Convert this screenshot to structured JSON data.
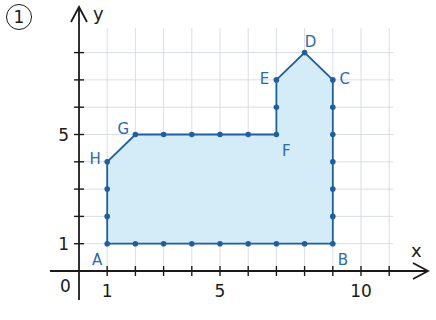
{
  "exercise": {
    "number_label": "1"
  },
  "axes": {
    "x_label": "x",
    "y_label": "y",
    "origin_label": "0",
    "x_tick_labels": [
      {
        "value": 1,
        "label": "1"
      },
      {
        "value": 5,
        "label": "5"
      },
      {
        "value": 10,
        "label": "10"
      }
    ],
    "y_tick_labels": [
      {
        "value": 1,
        "label": "1"
      },
      {
        "value": 5,
        "label": "5"
      }
    ]
  },
  "colors": {
    "axis": "#1a1a1a",
    "grid": "#cfd6dc",
    "polygon_stroke": "#1f5f9e",
    "polygon_fill": "#d4ecf8",
    "point": "#1f5f9e",
    "vertex_label": "#2a6aab"
  },
  "polygon": {
    "vertices": [
      {
        "name": "A",
        "x": 1,
        "y": 1
      },
      {
        "name": "B",
        "x": 9,
        "y": 1
      },
      {
        "name": "C",
        "x": 9,
        "y": 7
      },
      {
        "name": "D",
        "x": 8,
        "y": 8
      },
      {
        "name": "E",
        "x": 7,
        "y": 7
      },
      {
        "name": "F",
        "x": 7,
        "y": 5
      },
      {
        "name": "G",
        "x": 2,
        "y": 5
      },
      {
        "name": "H",
        "x": 1,
        "y": 4
      }
    ]
  },
  "chart_data": {
    "type": "scatter",
    "title": "1",
    "xlabel": "x",
    "ylabel": "y",
    "xlim": [
      0,
      11
    ],
    "ylim": [
      0,
      8
    ],
    "grid": true,
    "series": [
      {
        "name": "Polygon ABCDEFGH",
        "points": [
          {
            "label": "A",
            "x": 1,
            "y": 1
          },
          {
            "label": "B",
            "x": 9,
            "y": 1
          },
          {
            "label": "C",
            "x": 9,
            "y": 7
          },
          {
            "label": "D",
            "x": 8,
            "y": 8
          },
          {
            "label": "E",
            "x": 7,
            "y": 7
          },
          {
            "label": "F",
            "x": 7,
            "y": 5
          },
          {
            "label": "G",
            "x": 2,
            "y": 5
          },
          {
            "label": "H",
            "x": 1,
            "y": 4
          }
        ]
      }
    ],
    "lattice_points_on_boundary": [
      [
        1,
        1
      ],
      [
        2,
        1
      ],
      [
        3,
        1
      ],
      [
        4,
        1
      ],
      [
        5,
        1
      ],
      [
        6,
        1
      ],
      [
        7,
        1
      ],
      [
        8,
        1
      ],
      [
        9,
        1
      ],
      [
        9,
        2
      ],
      [
        9,
        3
      ],
      [
        9,
        4
      ],
      [
        9,
        5
      ],
      [
        9,
        6
      ],
      [
        9,
        7
      ],
      [
        8,
        8
      ],
      [
        7,
        7
      ],
      [
        7,
        6
      ],
      [
        7,
        5
      ],
      [
        6,
        5
      ],
      [
        5,
        5
      ],
      [
        4,
        5
      ],
      [
        3,
        5
      ],
      [
        2,
        5
      ],
      [
        1,
        4
      ],
      [
        1,
        3
      ],
      [
        1,
        2
      ]
    ],
    "x_ticks": [
      1,
      2,
      3,
      4,
      5,
      6,
      7,
      8,
      9,
      10,
      11
    ],
    "y_ticks": [
      1,
      2,
      3,
      4,
      5,
      6,
      7,
      8
    ],
    "x_tick_labels": [
      "1",
      "5",
      "10"
    ],
    "y_tick_labels": [
      "1",
      "5"
    ]
  }
}
